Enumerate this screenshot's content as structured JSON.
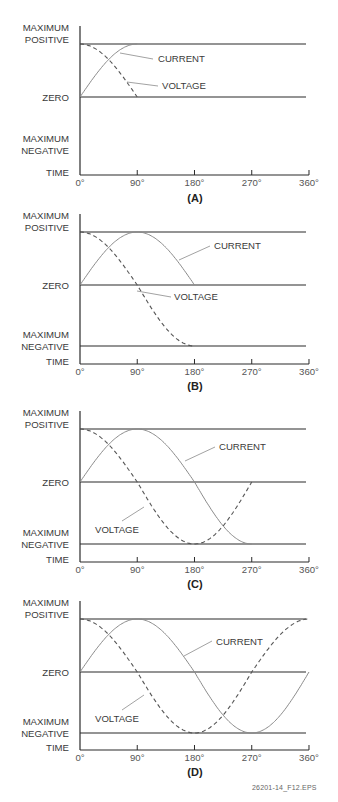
{
  "figure": {
    "footer_id": "26201-14_F12.EPS",
    "y_labels": {
      "max_positive": [
        "MAXIMUM",
        "POSITIVE"
      ],
      "zero": "ZERO",
      "max_negative": [
        "MAXIMUM",
        "NEGATIVE"
      ],
      "time": "TIME"
    },
    "x_ticks": [
      "0°",
      "90°",
      "180°",
      "270°",
      "360°"
    ],
    "series_labels": {
      "current": "CURRENT",
      "voltage": "VOLTAGE"
    },
    "colors": {
      "axis": "#2a2a2a",
      "current": "#8a8a8a",
      "voltage": "#555555",
      "leader": "#8a8a8a"
    }
  },
  "chart_data": [
    {
      "type": "line",
      "title": "(A)",
      "xlabel": "TIME",
      "ylabel": "",
      "xlim": [
        0,
        360
      ],
      "ylim": [
        -1,
        1
      ],
      "x_ticks": [
        0,
        90,
        180,
        270,
        360
      ],
      "show_max_negative_line": false,
      "series": [
        {
          "name": "CURRENT",
          "style": "solid",
          "function": "sin",
          "x_range": [
            0,
            90
          ],
          "values_desc": "0 → +1 (rises to maximum positive at 90°)"
        },
        {
          "name": "VOLTAGE",
          "style": "dashed",
          "function": "cos",
          "x_range": [
            0,
            90
          ],
          "values_desc": "+1 → 0 (falls to zero at 90°)"
        }
      ]
    },
    {
      "type": "line",
      "title": "(B)",
      "xlabel": "TIME",
      "xlim": [
        0,
        360
      ],
      "ylim": [
        -1,
        1
      ],
      "x_ticks": [
        0,
        90,
        180,
        270,
        360
      ],
      "show_max_negative_line": true,
      "series": [
        {
          "name": "CURRENT",
          "style": "solid",
          "function": "sin",
          "x_range": [
            0,
            180
          ],
          "values_desc": "0 → +1 at 90° → 0 at 180°"
        },
        {
          "name": "VOLTAGE",
          "style": "dashed",
          "function": "cos",
          "x_range": [
            0,
            180
          ],
          "values_desc": "+1 → 0 at 90° → -1 at 180°"
        }
      ]
    },
    {
      "type": "line",
      "title": "(C)",
      "xlabel": "TIME",
      "xlim": [
        0,
        360
      ],
      "ylim": [
        -1,
        1
      ],
      "x_ticks": [
        0,
        90,
        180,
        270,
        360
      ],
      "show_max_negative_line": true,
      "series": [
        {
          "name": "CURRENT",
          "style": "solid",
          "function": "sin",
          "x_range": [
            0,
            270
          ],
          "values_desc": "0 → +1 at 90° → 0 at 180° → -1 at 270°"
        },
        {
          "name": "VOLTAGE",
          "style": "dashed",
          "function": "cos",
          "x_range": [
            0,
            270
          ],
          "values_desc": "+1 → 0 at 90° → -1 at 180° → 0 at 270°"
        }
      ]
    },
    {
      "type": "line",
      "title": "(D)",
      "xlabel": "TIME",
      "xlim": [
        0,
        360
      ],
      "ylim": [
        -1,
        1
      ],
      "x_ticks": [
        0,
        90,
        180,
        270,
        360
      ],
      "show_max_negative_line": true,
      "series": [
        {
          "name": "CURRENT",
          "style": "solid",
          "function": "sin",
          "x_range": [
            0,
            360
          ],
          "values_desc": "0 → +1 at 90° → 0 at 180° → -1 at 270° → 0 at 360°"
        },
        {
          "name": "VOLTAGE",
          "style": "dashed",
          "function": "cos",
          "x_range": [
            0,
            360
          ],
          "values_desc": "+1 → 0 at 90° → -1 at 180° → 0 at 270° → +1 at 360°"
        }
      ]
    }
  ],
  "layout": {
    "panels": [
      {
        "top": 44,
        "zero": 97,
        "bottom": 150,
        "axis": 175,
        "axis_top": 26,
        "current_label": {
          "x": 158,
          "y": 62,
          "leader": [
            [
              120,
              53
            ],
            [
              153,
              59
            ]
          ]
        },
        "voltage_label": {
          "x": 162,
          "y": 89,
          "leader": [
            [
              127,
              82
            ],
            [
              158,
              86
            ]
          ]
        },
        "title_y": 202
      },
      {
        "top": 232,
        "zero": 285,
        "bottom": 346,
        "axis": 364,
        "axis_top": 214,
        "current_label": {
          "x": 214,
          "y": 249,
          "leader": [
            [
              179,
              260
            ],
            [
              210,
              246
            ]
          ]
        },
        "voltage_label": {
          "x": 174,
          "y": 300,
          "leader": [
            [
              137,
              291
            ],
            [
              171,
              297
            ]
          ]
        },
        "title_y": 390
      },
      {
        "top": 429,
        "zero": 482,
        "bottom": 544,
        "axis": 562,
        "axis_top": 411,
        "current_label": {
          "x": 219,
          "y": 450,
          "leader": [
            [
              185,
              461
            ],
            [
              215,
              447
            ]
          ]
        },
        "voltage_label": {
          "x": 95,
          "y": 533,
          "leader": [
            [
              144,
              507
            ],
            [
              122,
              521
            ]
          ]
        },
        "title_y": 588
      },
      {
        "top": 619,
        "zero": 672,
        "bottom": 733,
        "axis": 750,
        "axis_top": 601,
        "current_label": {
          "x": 216,
          "y": 645,
          "leader": [
            [
              184,
              656
            ],
            [
              212,
              641
            ]
          ]
        },
        "voltage_label": {
          "x": 95,
          "y": 722,
          "leader": [
            [
              144,
              695
            ],
            [
              122,
              710
            ]
          ]
        },
        "title_y": 776
      }
    ],
    "x0": 80,
    "x_per_deg": 0.6361,
    "line_end": 306,
    "label_right": 69
  }
}
